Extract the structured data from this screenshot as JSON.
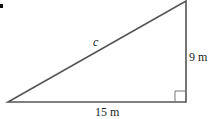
{
  "diagram": {
    "type": "right-triangle",
    "labels": {
      "hypotenuse": "c",
      "vertical_side": "9 m",
      "horizontal_side": "15 m"
    },
    "right_angle_marker": true,
    "colors": {
      "stroke": "#555555",
      "text": "#222222",
      "background": "#ffffff"
    }
  }
}
